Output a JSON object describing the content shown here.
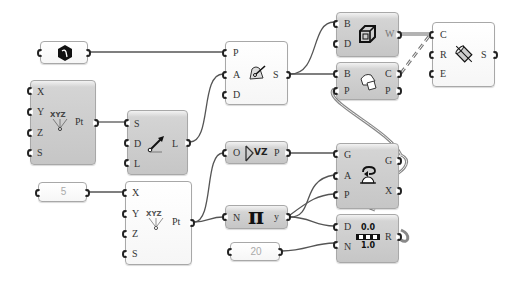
{
  "canvas": {
    "background": "#ffffff",
    "wire_color": "#555555"
  },
  "components": {
    "geometry_param": {
      "icon": "hexagon-geometry-icon"
    },
    "construct_point_1": {
      "inputs": [
        "X",
        "Y",
        "Z",
        "S"
      ],
      "outputs": [
        "Pt"
      ],
      "icon": "xyz-point-icon",
      "icon_text": "XYZ"
    },
    "line_sdl": {
      "inputs": [
        "S",
        "D",
        "L"
      ],
      "outputs": [
        "L"
      ],
      "icon": "line-arrow-icon"
    },
    "number_5": {
      "value": "5"
    },
    "construct_point_2": {
      "inputs": [
        "X",
        "Y",
        "Z",
        "S"
      ],
      "outputs": [
        "Pt"
      ],
      "icon": "xyz-point-icon",
      "icon_text": "XYZ"
    },
    "plane": {
      "inputs": [
        "P",
        "A",
        "D"
      ],
      "outputs": [
        "S"
      ],
      "icon": "plane-surface-icon"
    },
    "box": {
      "inputs": [
        "B",
        "D"
      ],
      "outputs": [
        "W"
      ],
      "icon": "box-cube-icon"
    },
    "cylinder": {
      "inputs": [
        "C",
        "R",
        "E"
      ],
      "outputs": [
        "S"
      ],
      "icon": "cylinder-icon"
    },
    "deconstruct_brep": {
      "inputs": [
        "B",
        "P"
      ],
      "outputs": [
        "C",
        "P"
      ],
      "icon": "brep-deconstruct-icon"
    },
    "unit_z": {
      "inputs": [
        "O"
      ],
      "outputs": [
        "P"
      ],
      "icon": "vector-z-icon",
      "icon_text": "VZ"
    },
    "rotate": {
      "inputs": [
        "G",
        "A",
        "P"
      ],
      "outputs": [
        "G",
        "X"
      ],
      "icon": "rotate-icon"
    },
    "pi": {
      "inputs": [
        "N"
      ],
      "outputs": [
        "y"
      ],
      "icon": "pi-icon",
      "icon_text": "π"
    },
    "divide": {
      "inputs": [
        "D",
        "N"
      ],
      "outputs": [
        "R"
      ],
      "icon": "divide-icon",
      "icon_top": "0.0",
      "icon_bottom": "1.0"
    },
    "number_20": {
      "value": "20"
    }
  }
}
